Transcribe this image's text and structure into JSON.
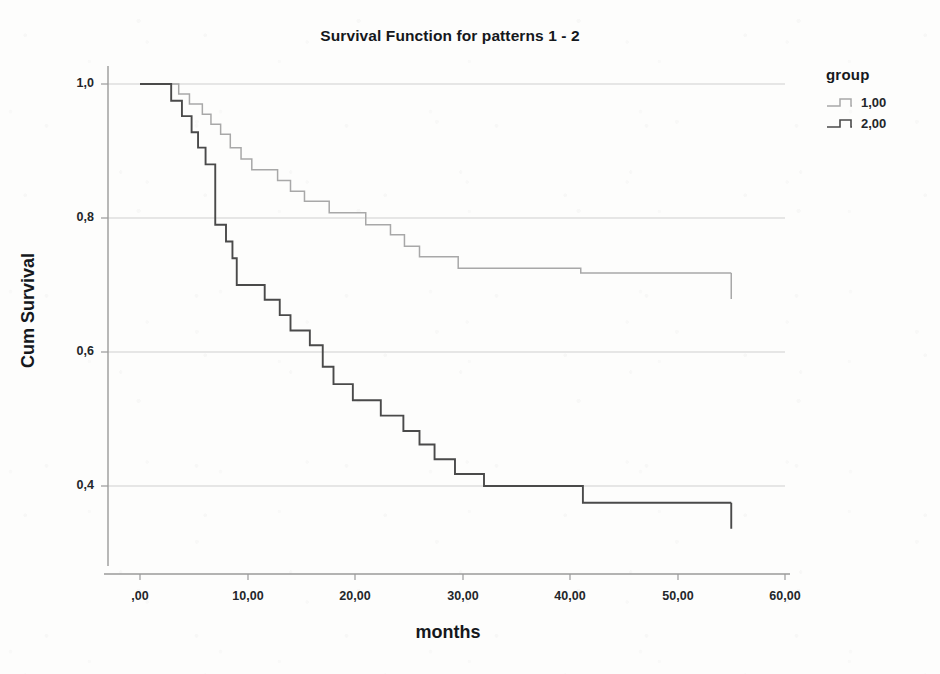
{
  "chart_data": {
    "type": "line",
    "subtype": "kaplan-meier-survival",
    "title": "Survival Function for patterns 1 - 2",
    "xlabel": "months",
    "ylabel": "Cum Survival",
    "xlim": [
      -3,
      63
    ],
    "ylim": [
      0.3,
      1.04
    ],
    "xticks": [
      0,
      10,
      20,
      30,
      40,
      50,
      60
    ],
    "xtick_labels": [
      ",00",
      "10,00",
      "20,00",
      "30,00",
      "40,00",
      "50,00",
      "60,00"
    ],
    "yticks": [
      0.4,
      0.6,
      0.8,
      1.0
    ],
    "ytick_labels": [
      "0,4",
      "0,6",
      "0,8",
      "1,0"
    ],
    "grid": "horizontal",
    "legend_title": "group",
    "legend_position": "right",
    "series": [
      {
        "name": "1,00",
        "label": "1,00",
        "color": "#a8a8a8",
        "censor_marks": [
          55.0
        ],
        "steps": [
          [
            0.0,
            1.0
          ],
          [
            3.6,
            1.0
          ],
          [
            3.6,
            0.985
          ],
          [
            4.6,
            0.985
          ],
          [
            4.6,
            0.97
          ],
          [
            5.8,
            0.97
          ],
          [
            5.8,
            0.955
          ],
          [
            6.6,
            0.955
          ],
          [
            6.6,
            0.94
          ],
          [
            7.5,
            0.94
          ],
          [
            7.5,
            0.925
          ],
          [
            8.4,
            0.925
          ],
          [
            8.4,
            0.905
          ],
          [
            9.4,
            0.905
          ],
          [
            9.4,
            0.888
          ],
          [
            10.4,
            0.888
          ],
          [
            10.4,
            0.872
          ],
          [
            12.8,
            0.872
          ],
          [
            12.8,
            0.856
          ],
          [
            14.0,
            0.856
          ],
          [
            14.0,
            0.84
          ],
          [
            15.3,
            0.84
          ],
          [
            15.3,
            0.825
          ],
          [
            17.6,
            0.825
          ],
          [
            17.6,
            0.808
          ],
          [
            21.0,
            0.808
          ],
          [
            21.0,
            0.79
          ],
          [
            23.3,
            0.79
          ],
          [
            23.3,
            0.775
          ],
          [
            24.6,
            0.775
          ],
          [
            24.6,
            0.758
          ],
          [
            26.0,
            0.758
          ],
          [
            26.0,
            0.742
          ],
          [
            29.6,
            0.742
          ],
          [
            29.6,
            0.725
          ],
          [
            41.0,
            0.725
          ],
          [
            41.0,
            0.718
          ],
          [
            55.0,
            0.718
          ]
        ]
      },
      {
        "name": "2,00",
        "label": "2,00",
        "color": "#4a4a4a",
        "censor_marks": [
          55.0
        ],
        "steps": [
          [
            0.0,
            1.0
          ],
          [
            2.9,
            1.0
          ],
          [
            2.9,
            0.975
          ],
          [
            3.9,
            0.975
          ],
          [
            3.9,
            0.952
          ],
          [
            4.8,
            0.952
          ],
          [
            4.8,
            0.928
          ],
          [
            5.4,
            0.928
          ],
          [
            5.4,
            0.905
          ],
          [
            6.1,
            0.905
          ],
          [
            6.1,
            0.88
          ],
          [
            7.0,
            0.88
          ],
          [
            7.0,
            0.855
          ],
          [
            7.0,
            0.79
          ],
          [
            8.0,
            0.79
          ],
          [
            8.0,
            0.765
          ],
          [
            8.6,
            0.765
          ],
          [
            8.6,
            0.74
          ],
          [
            9.0,
            0.74
          ],
          [
            9.0,
            0.7
          ],
          [
            11.6,
            0.7
          ],
          [
            11.6,
            0.678
          ],
          [
            13.0,
            0.678
          ],
          [
            13.0,
            0.655
          ],
          [
            14.0,
            0.655
          ],
          [
            14.0,
            0.632
          ],
          [
            15.8,
            0.632
          ],
          [
            15.8,
            0.61
          ],
          [
            17.0,
            0.61
          ],
          [
            17.0,
            0.578
          ],
          [
            18.0,
            0.578
          ],
          [
            18.0,
            0.552
          ],
          [
            19.8,
            0.552
          ],
          [
            19.8,
            0.528
          ],
          [
            22.4,
            0.528
          ],
          [
            22.4,
            0.505
          ],
          [
            24.5,
            0.505
          ],
          [
            24.5,
            0.482
          ],
          [
            26.0,
            0.482
          ],
          [
            26.0,
            0.462
          ],
          [
            27.4,
            0.462
          ],
          [
            27.4,
            0.44
          ],
          [
            29.3,
            0.44
          ],
          [
            29.3,
            0.418
          ],
          [
            32.0,
            0.418
          ],
          [
            32.0,
            0.4
          ],
          [
            41.2,
            0.4
          ],
          [
            41.2,
            0.375
          ],
          [
            55.0,
            0.375
          ]
        ]
      }
    ]
  },
  "legend": {
    "title": "group",
    "entries": [
      {
        "label": "1,00",
        "color": "#a8a8a8"
      },
      {
        "label": "2,00",
        "color": "#4a4a4a"
      }
    ]
  },
  "axes": {
    "x_title": "months",
    "y_title": "Cum Survival",
    "x_tick_labels": [
      ",00",
      "10,00",
      "20,00",
      "30,00",
      "40,00",
      "50,00",
      "60,00"
    ],
    "y_tick_labels": [
      "1,0",
      "0,8",
      "0,6",
      "0,4"
    ]
  },
  "title": "Survival Function for patterns 1 - 2",
  "colors": {
    "group1": "#a8a8a8",
    "group2": "#4a4a4a",
    "axis": "#9a9a9a",
    "grid": "#cfcfcf",
    "text": "#15181c"
  }
}
